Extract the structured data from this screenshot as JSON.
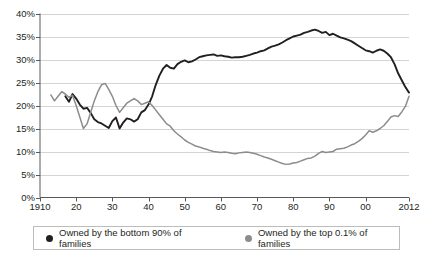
{
  "chart_data": {
    "type": "line",
    "title": "",
    "subtitle": "",
    "xlabel": "",
    "ylabel": "",
    "xlim": [
      1910,
      2012
    ],
    "ylim": [
      0,
      40
    ],
    "grid": true,
    "legend_position": "bottom",
    "y_ticks": [
      "0%",
      "5%",
      "10%",
      "15%",
      "20%",
      "25%",
      "30%",
      "35%",
      "40%"
    ],
    "y_tick_values": [
      0,
      5,
      10,
      15,
      20,
      25,
      30,
      35,
      40
    ],
    "x_ticks": [
      "1910",
      "20",
      "30",
      "40",
      "50",
      "60",
      "70",
      "80",
      "90",
      "00",
      "2012"
    ],
    "x_tick_values": [
      1910,
      1920,
      1930,
      1940,
      1950,
      1960,
      1970,
      1980,
      1990,
      2000,
      2012
    ],
    "series": [
      {
        "name": "Owned by the bottom 90% of families",
        "color": "#231f20",
        "x": [
          1917,
          1918,
          1919,
          1920,
          1921,
          1922,
          1923,
          1924,
          1925,
          1926,
          1927,
          1928,
          1929,
          1930,
          1931,
          1932,
          1933,
          1934,
          1935,
          1936,
          1937,
          1938,
          1939,
          1940,
          1941,
          1942,
          1943,
          1944,
          1945,
          1946,
          1947,
          1948,
          1949,
          1950,
          1951,
          1952,
          1953,
          1954,
          1955,
          1956,
          1957,
          1958,
          1959,
          1960,
          1961,
          1962,
          1963,
          1964,
          1965,
          1966,
          1967,
          1968,
          1969,
          1970,
          1971,
          1972,
          1973,
          1974,
          1975,
          1976,
          1977,
          1978,
          1979,
          1980,
          1981,
          1982,
          1983,
          1984,
          1985,
          1986,
          1987,
          1988,
          1989,
          1990,
          1991,
          1992,
          1993,
          1994,
          1995,
          1996,
          1997,
          1998,
          1999,
          2000,
          2001,
          2002,
          2003,
          2004,
          2005,
          2006,
          2007,
          2008,
          2009,
          2010,
          2011,
          2012
        ],
        "y": [
          22.0,
          20.8,
          22.5,
          21.5,
          20.2,
          19.3,
          19.5,
          18.4,
          17.0,
          16.4,
          16.1,
          15.6,
          15.1,
          16.6,
          17.4,
          15.0,
          16.3,
          17.2,
          17.0,
          16.5,
          17.0,
          18.5,
          19.0,
          20.2,
          22.0,
          24.5,
          26.5,
          28.0,
          28.8,
          28.2,
          28.0,
          29.0,
          29.5,
          29.8,
          29.4,
          29.6,
          30.0,
          30.5,
          30.7,
          30.9,
          31.0,
          31.1,
          30.8,
          30.9,
          30.7,
          30.6,
          30.4,
          30.5,
          30.5,
          30.6,
          30.8,
          31.0,
          31.3,
          31.5,
          31.8,
          32.0,
          32.4,
          32.8,
          33.0,
          33.3,
          33.7,
          34.2,
          34.6,
          35.0,
          35.2,
          35.4,
          35.8,
          36.0,
          36.3,
          36.5,
          36.2,
          35.8,
          36.0,
          35.3,
          35.6,
          35.2,
          34.8,
          34.6,
          34.3,
          34.0,
          33.5,
          33.0,
          32.5,
          32.0,
          31.8,
          31.5,
          31.9,
          32.2,
          31.9,
          31.3,
          30.5,
          29.0,
          27.0,
          25.5,
          24.0,
          22.8
        ]
      },
      {
        "name": "Owned by the top 0.1% of families",
        "color": "#8c8c8c",
        "x": [
          1913,
          1914,
          1915,
          1916,
          1917,
          1918,
          1919,
          1920,
          1921,
          1922,
          1923,
          1924,
          1925,
          1926,
          1927,
          1928,
          1929,
          1930,
          1931,
          1932,
          1933,
          1934,
          1935,
          1936,
          1937,
          1938,
          1939,
          1940,
          1941,
          1942,
          1943,
          1944,
          1945,
          1946,
          1947,
          1948,
          1949,
          1950,
          1951,
          1952,
          1953,
          1954,
          1955,
          1956,
          1957,
          1958,
          1959,
          1960,
          1961,
          1962,
          1963,
          1964,
          1965,
          1966,
          1967,
          1968,
          1969,
          1970,
          1971,
          1972,
          1973,
          1974,
          1975,
          1976,
          1977,
          1978,
          1979,
          1980,
          1981,
          1982,
          1983,
          1984,
          1985,
          1986,
          1987,
          1988,
          1989,
          1990,
          1991,
          1992,
          1993,
          1994,
          1995,
          1996,
          1997,
          1998,
          1999,
          2000,
          2001,
          2002,
          2003,
          2004,
          2005,
          2006,
          2007,
          2008,
          2009,
          2010,
          2011,
          2012
        ],
        "y": [
          22.3,
          21.0,
          22.0,
          23.0,
          22.5,
          21.8,
          22.2,
          20.0,
          17.5,
          15.0,
          16.0,
          18.5,
          21.0,
          23.0,
          24.5,
          24.8,
          23.5,
          22.0,
          20.0,
          18.5,
          19.5,
          20.5,
          21.0,
          21.5,
          21.0,
          20.2,
          20.5,
          20.8,
          20.0,
          19.0,
          18.0,
          17.0,
          16.0,
          15.5,
          14.5,
          13.8,
          13.2,
          12.5,
          12.0,
          11.6,
          11.2,
          11.0,
          10.7,
          10.5,
          10.2,
          10.0,
          9.9,
          9.8,
          9.9,
          9.8,
          9.6,
          9.5,
          9.7,
          9.8,
          9.9,
          9.8,
          9.6,
          9.4,
          9.1,
          8.8,
          8.6,
          8.3,
          8.0,
          7.7,
          7.4,
          7.2,
          7.3,
          7.5,
          7.6,
          7.9,
          8.2,
          8.5,
          8.6,
          9.0,
          9.6,
          10.0,
          9.8,
          9.9,
          10.0,
          10.5,
          10.6,
          10.7,
          11.0,
          11.4,
          11.7,
          12.2,
          12.8,
          13.6,
          14.5,
          14.2,
          14.5,
          15.0,
          15.6,
          16.5,
          17.5,
          17.8,
          17.6,
          18.6,
          19.8,
          22.0
        ]
      }
    ]
  },
  "legend": {
    "entries": [
      {
        "label": "Owned by the bottom 90% of families",
        "color": "#231f20"
      },
      {
        "label": "Owned by the top 0.1% of families",
        "color": "#8c8c8c"
      }
    ]
  },
  "colors": {
    "bottom90": "#231f20",
    "top01": "#8c8c8c",
    "gridline": "#d4d4d4",
    "axis": "#595959",
    "background": "#ffffff"
  }
}
